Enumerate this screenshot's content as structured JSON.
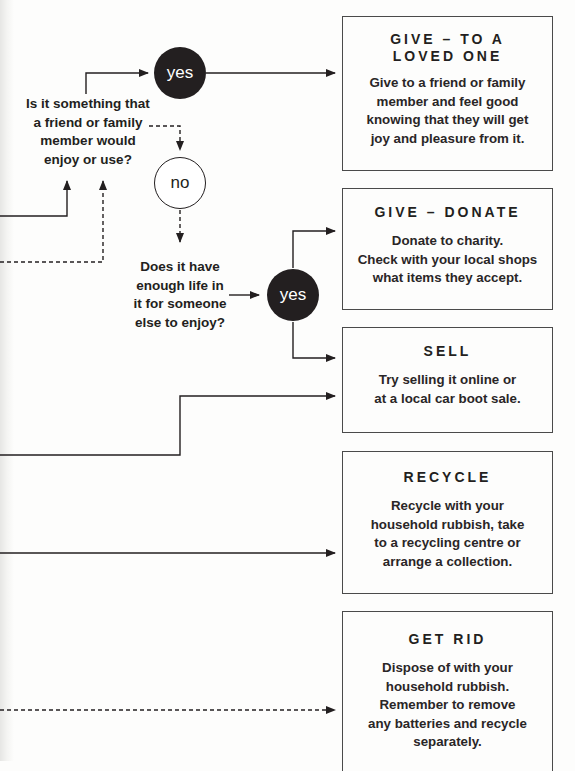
{
  "diagram": {
    "questions": [
      {
        "id": "q-friend-family",
        "lines": [
          "Is it something that",
          "a friend or family",
          "member would",
          "enjoy or use?"
        ]
      },
      {
        "id": "q-enough-life",
        "lines": [
          "Does it have",
          "enough life in",
          "it for someone",
          "else to enjoy?"
        ]
      }
    ],
    "nodes": {
      "yes_top": "yes",
      "no_mid": "no",
      "yes_second": "yes"
    },
    "outcomes": [
      {
        "title_lines": [
          "GIVE – TO A",
          "LOVED ONE"
        ],
        "body_lines": [
          "Give to a friend or family",
          "member and feel good",
          "knowing that they will get",
          "joy and pleasure from it."
        ]
      },
      {
        "title_lines": [
          "GIVE – DONATE"
        ],
        "body_lines": [
          "Donate to charity.",
          "Check with your local shops",
          "what items they accept."
        ]
      },
      {
        "title_lines": [
          "SELL"
        ],
        "body_lines": [
          "Try selling it online or",
          "at a local car boot sale."
        ]
      },
      {
        "title_lines": [
          "RECYCLE"
        ],
        "body_lines": [
          "Recycle with your",
          "household rubbish, take",
          "to a recycling centre or",
          "arrange a collection."
        ]
      },
      {
        "title_lines": [
          "GET RID"
        ],
        "body_lines": [
          "Dispose of with your",
          "household rubbish.",
          "Remember to remove",
          "any batteries and recycle",
          "separately."
        ]
      }
    ],
    "colors": {
      "ink": "#231f20",
      "box_border": "#4a4a4a",
      "background": "#fdfdfc"
    }
  }
}
